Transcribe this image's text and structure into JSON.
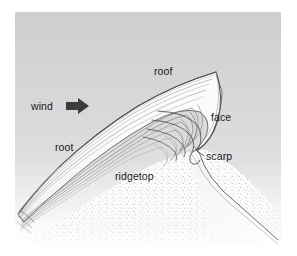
{
  "figure": {
    "caption": "",
    "width": 297,
    "height": 256
  },
  "colors": {
    "page_background": "#ffffff",
    "panel_background_top": "#d0d0d0",
    "panel_background_mid": "#d9d9d9",
    "panel_background_bottom": "#ffffff",
    "outline": "#5a5a5a",
    "layer_line": "#8a8a8a",
    "layer_line_dark": "#6e6e6e",
    "snow_fill": "#fbfbfb",
    "ridge_stipple": "#b8b8b8",
    "label_text": "#1a1a1a",
    "arrow_fill": "#3c3c3c"
  },
  "panel": {
    "x": 15,
    "y": 12,
    "width": 266,
    "height": 232
  },
  "labels": [
    {
      "id": "wind",
      "text": "wind",
      "x": 31,
      "y": 110,
      "anchor": "start"
    },
    {
      "id": "roof",
      "text": "roof",
      "x": 154,
      "y": 75,
      "anchor": "start"
    },
    {
      "id": "face",
      "text": "face",
      "x": 211,
      "y": 121,
      "anchor": "start"
    },
    {
      "id": "root",
      "text": "root",
      "x": 55,
      "y": 151,
      "anchor": "start"
    },
    {
      "id": "scarp",
      "text": "scarp",
      "x": 206,
      "y": 160,
      "anchor": "start"
    },
    {
      "id": "ridgetop",
      "text": "ridgetop",
      "x": 115,
      "y": 180,
      "anchor": "start"
    }
  ],
  "wind_arrow": {
    "label": "wind-direction-arrow",
    "direction": "right",
    "x": 70,
    "y": 106,
    "length": 20,
    "head_width": 13
  },
  "leader_lines": [
    {
      "id": "scarp-leader",
      "from_x": 205,
      "from_y": 156,
      "to_x": 195,
      "to_y": 148
    }
  ],
  "geometry": {
    "cornice_tip": {
      "x": 216,
      "y": 72
    },
    "roof_description": "convex windward upper surface rising from lower-left to the tip",
    "face_description": "steep concave lee face curving down from the tip",
    "root_description": "layered snow tapering down to lower-left over the ridge",
    "scarp_description": "small step notch below the face",
    "ridgetop_description": "stippled ground mass beneath the snow drift",
    "layer_count": 11
  },
  "icon_names": {
    "wind_arrow": "arrow-right-icon"
  }
}
